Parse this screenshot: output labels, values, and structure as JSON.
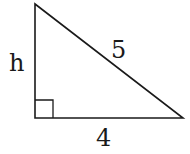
{
  "diagram": {
    "type": "right-triangle",
    "labels": {
      "height": "h",
      "hypotenuse": "5",
      "base": "4"
    },
    "colors": {
      "stroke": "#1a1a1a",
      "background": "#ffffff"
    }
  }
}
